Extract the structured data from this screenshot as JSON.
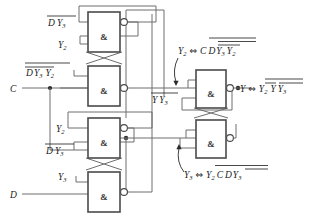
{
  "diagram": {
    "type": "logic-circuit-schematic",
    "width": 311,
    "height": 218,
    "colors": {
      "background": "#ffffff",
      "wire": "#6f6f6f",
      "gate_outline": "#4a4a4a",
      "text": "#1a1a1a",
      "node": "#2a2a2a"
    }
  },
  "gates": [
    {
      "id": "g1",
      "symbol": "&",
      "kind": "nand",
      "x": 88,
      "y": 12,
      "w": 32,
      "h": 40
    },
    {
      "id": "g2",
      "symbol": "&",
      "kind": "nand",
      "x": 88,
      "y": 66,
      "w": 32,
      "h": 40
    },
    {
      "id": "g3",
      "symbol": "&",
      "kind": "nand",
      "x": 88,
      "y": 118,
      "w": 32,
      "h": 40
    },
    {
      "id": "g4",
      "symbol": "&",
      "kind": "nand",
      "x": 88,
      "y": 172,
      "w": 32,
      "h": 40
    },
    {
      "id": "g5",
      "symbol": "&",
      "kind": "nand",
      "x": 196,
      "y": 70,
      "w": 30,
      "h": 38
    },
    {
      "id": "g6",
      "symbol": "&",
      "kind": "nand",
      "x": 196,
      "y": 120,
      "w": 30,
      "h": 38
    }
  ],
  "inputs": {
    "c_label": "C",
    "d_label": "D"
  },
  "signal_labels": {
    "g1_in_top": {
      "text": "D Y3",
      "bars": "full"
    },
    "g1_in_bottom": {
      "text": "Y2",
      "bars": "none"
    },
    "g2_in_top": {
      "text": "D Y3 Y2",
      "bars": "nested"
    },
    "g3_in_top": {
      "text": "Y2",
      "bars": "none"
    },
    "g3_in_bottom": {
      "text": "D Y3",
      "bars": "full"
    },
    "g4_in_top": {
      "text": "Y3",
      "bars": "none"
    },
    "g5_mid": {
      "text": "Y Y3",
      "bars": "full"
    }
  },
  "annotations": {
    "y2_equiv": "Y2 ⇔ C D Y3 Y2",
    "y_equiv": "Y ⇔ Y2 Y Y3",
    "y3_equiv": "Y3 ⇔ Y2 C D Y3",
    "y_out": "Y",
    "equiv_symbol": "⇔"
  },
  "text": {
    "label_D_Y3": "D",
    "label_Y3_sub": "3",
    "label_Y2": "Y",
    "label_Y2_sub": "2",
    "label_Y": "Y",
    "label_C": "C",
    "label_Dm": "D",
    "amp": "&"
  }
}
